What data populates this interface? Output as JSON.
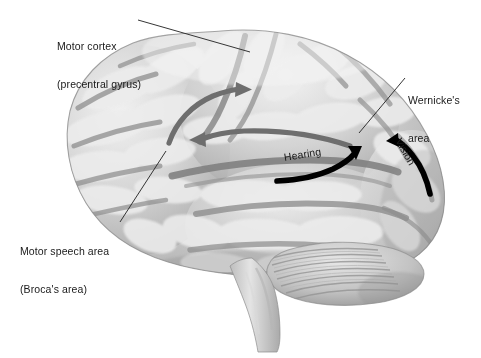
{
  "figure": {
    "title": "Lateral view of the left cerebral hemisphere showing language and sensory cortical areas",
    "view": "left lateral",
    "background_color": "#ffffff",
    "text_color": "#1a1a1a",
    "leader_line_color": "#2a2a2a",
    "gray_arrow_color": "#6e6e6e",
    "black_arrow_color": "#000000",
    "brain_light": "#e9e9e9",
    "brain_mid": "#bdbdbd",
    "brain_dark": "#8f8f8f",
    "sulcus_color": "#9a9a9a"
  },
  "labels": {
    "motor_cortex": {
      "line1": "Motor cortex",
      "line2": "(precentral gyrus)"
    },
    "wernicke": {
      "line1": "Wernicke's",
      "line2": "area"
    },
    "broca": {
      "line1": "Motor speech area",
      "line2": "(Broca's area)"
    },
    "hearing": "Hearing",
    "vision": "Vision"
  },
  "arrows": [
    {
      "name": "broca-to-motor-cortex",
      "color": "#6e6e6e",
      "style": "gray curved",
      "direction": "up-right",
      "meaning": "pathway from Broca's area to motor cortex"
    },
    {
      "name": "wernicke-to-broca",
      "color": "#6e6e6e",
      "style": "gray curved",
      "direction": "left",
      "meaning": "arcuate fasciculus pathway from Wernicke's area to Broca's area"
    },
    {
      "name": "hearing-input",
      "color": "#000000",
      "style": "black curved",
      "direction": "up-right",
      "meaning": "auditory input to Wernicke's area"
    },
    {
      "name": "vision-input",
      "color": "#000000",
      "style": "black curved",
      "direction": "up-left",
      "meaning": "visual input to Wernicke's area"
    }
  ]
}
